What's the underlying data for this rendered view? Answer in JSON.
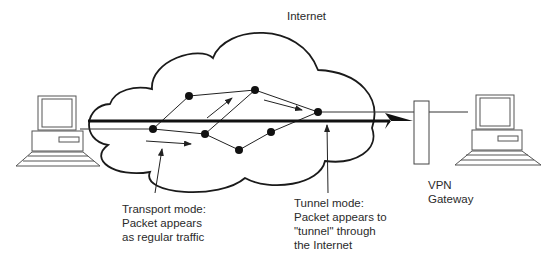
{
  "diagram": {
    "cloud_label": "Internet",
    "transport_label": [
      "Transport mode:",
      "Packet appears",
      "as regular traffic"
    ],
    "tunnel_label": [
      "Tunnel mode:",
      "Packet appears to",
      "\"tunnel\" through",
      "the Internet"
    ],
    "gateway_label": [
      "VPN",
      "Gateway"
    ],
    "colors": {
      "stroke": "#1a1a1a",
      "background": "#ffffff",
      "text": "#2a2a2a"
    },
    "nodes": [
      {
        "id": "A",
        "x": 153,
        "y": 129
      },
      {
        "id": "B",
        "x": 189,
        "y": 96
      },
      {
        "id": "C",
        "x": 255,
        "y": 90
      },
      {
        "id": "D",
        "x": 205,
        "y": 134
      },
      {
        "id": "E",
        "x": 318,
        "y": 112
      },
      {
        "id": "F",
        "x": 271,
        "y": 132
      },
      {
        "id": "G",
        "x": 239,
        "y": 150
      }
    ]
  }
}
